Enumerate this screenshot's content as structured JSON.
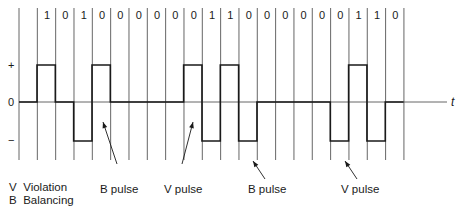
{
  "diagram": {
    "bits": [
      "1",
      "0",
      "1",
      "0",
      "0",
      "0",
      "0",
      "0",
      "0",
      "1",
      "1",
      "0",
      "0",
      "0",
      "0",
      "0",
      "0",
      "1",
      "1",
      "0"
    ],
    "levels": [
      "+",
      "0",
      "−"
    ],
    "signal": [
      "+",
      "0",
      "−",
      "+",
      "0",
      "0",
      "0",
      "0",
      "+",
      "−",
      "+",
      "−",
      "0",
      "0",
      "0",
      "0",
      "−",
      "+",
      "−",
      "0"
    ],
    "axis_label": "t",
    "annotations": [
      {
        "label": "B pulse",
        "target_bit_index": 3
      },
      {
        "label": "V pulse",
        "target_bit_index": 8
      },
      {
        "label": "B pulse",
        "target_bit_index": 11
      },
      {
        "label": "V pulse",
        "target_bit_index": 16
      }
    ],
    "legend": [
      {
        "key": "V",
        "text": "Violation"
      },
      {
        "key": "B",
        "text": "Balancing"
      }
    ],
    "colors": {
      "line": "#1a1a1a",
      "grid": "#555555"
    }
  }
}
